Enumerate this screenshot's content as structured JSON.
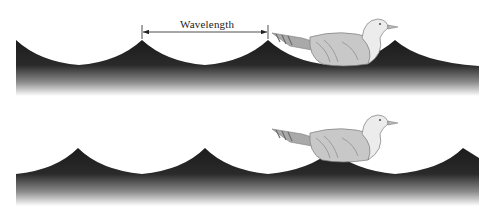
{
  "figure": {
    "wavelength_label": "Wavelength",
    "panels": [
      {
        "name": "top-wave",
        "description": "Bird sitting in trough between crests"
      },
      {
        "name": "bottom-wave",
        "description": "Bird riding on crest"
      }
    ],
    "colors": {
      "wave_dark": "#1e1e1e",
      "wave_fade": "#ffffff",
      "bird_body": "#c8c8c8",
      "bird_head": "#e8e8e8",
      "outline": "#7a7a7a"
    }
  }
}
